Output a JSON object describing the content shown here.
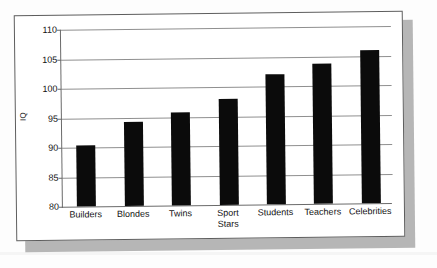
{
  "chart_data": {
    "type": "bar",
    "title": "",
    "xlabel": "",
    "ylabel": "IQ",
    "ylim": [
      80,
      110
    ],
    "ytick_step": 5,
    "yticks": [
      80,
      85,
      90,
      95,
      100,
      105,
      110
    ],
    "ytick_labels": [
      "80",
      "85",
      "90",
      "95",
      "100",
      "105",
      "110"
    ],
    "grid": true,
    "legend": false,
    "legend_position": "none",
    "categories": [
      "Builders",
      "Blondes",
      "Twins",
      "Sport Stars",
      "Students",
      "Teachers",
      "Celebrities"
    ],
    "category_lines": [
      [
        "Builders"
      ],
      [
        "Blondes"
      ],
      [
        "Twins"
      ],
      [
        "Sport",
        "Stars"
      ],
      [
        "Students"
      ],
      [
        "Teachers"
      ],
      [
        "Celebrities"
      ]
    ],
    "values": [
      90.4,
      94.2,
      95.7,
      98.0,
      102.1,
      103.8,
      105.9
    ],
    "series": [
      {
        "name": "IQ",
        "values": [
          90.4,
          94.2,
          95.7,
          98.0,
          102.1,
          103.8,
          105.9
        ]
      }
    ],
    "bar_color": "#0b0b0b",
    "grid_color": "#8f8f8f",
    "axis_color": "#6a6a6a",
    "plot_background": "#ffffff"
  },
  "figure": {
    "card_background": "#ffffff",
    "card_border_color": "#5d5d5d",
    "shadow_color": "#b6b6b6",
    "page_background": "#fdfdfd"
  }
}
